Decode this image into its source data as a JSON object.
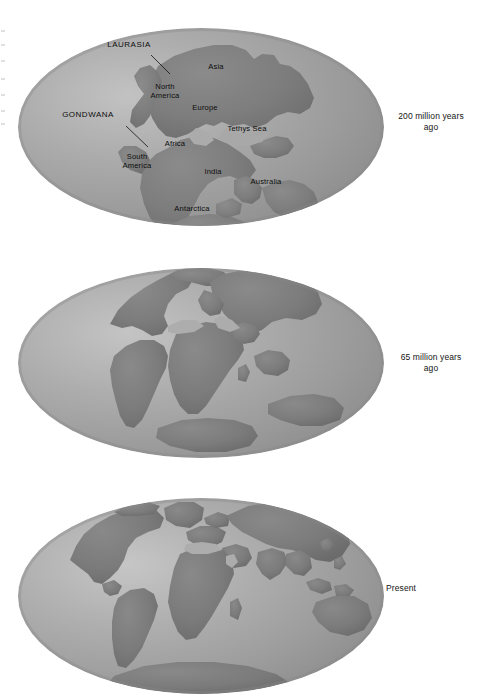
{
  "figure": {
    "kind": "continental-drift-diagram",
    "background_color": "#ffffff",
    "ocean_color": "#a6a6a6",
    "land_color": "#7d7d7d",
    "text_color": "#111111"
  },
  "panels": [
    {
      "id": "panel-200ma",
      "caption": "200 million years\nago",
      "caption_line1": "200 million years",
      "caption_line2": "ago",
      "labels": [
        {
          "name": "laurasia",
          "text": "LAURASIA",
          "style": "caps",
          "x": 103,
          "y": 44,
          "w": 62,
          "leader": [
            151,
            55,
            168,
            73
          ]
        },
        {
          "name": "gondwana",
          "text": "GONDWANA",
          "style": "caps",
          "x": 56,
          "y": 114,
          "w": 70,
          "leader": [
            126,
            126,
            147,
            146
          ]
        },
        {
          "name": "asia",
          "text": "Asia",
          "style": "normal",
          "x": 198,
          "y": 65,
          "w": 34
        },
        {
          "name": "north-america",
          "text": "North\nAmerica",
          "style": "normal",
          "x": 140,
          "y": 86,
          "w": 52
        },
        {
          "name": "europe",
          "text": "Europe",
          "style": "normal",
          "x": 183,
          "y": 106,
          "w": 42
        },
        {
          "name": "tethys-sea",
          "text": "Tethys Sea",
          "style": "normal",
          "x": 218,
          "y": 128,
          "w": 58
        },
        {
          "name": "africa",
          "text": "Africa",
          "style": "normal",
          "x": 156,
          "y": 142,
          "w": 38
        },
        {
          "name": "south-america",
          "text": "South\nAmerica",
          "style": "normal",
          "x": 111,
          "y": 155,
          "w": 52
        },
        {
          "name": "india",
          "text": "India",
          "style": "normal",
          "x": 197,
          "y": 170,
          "w": 32
        },
        {
          "name": "australia",
          "text": "Australia",
          "style": "normal",
          "x": 241,
          "y": 180,
          "w": 48
        },
        {
          "name": "antarctica",
          "text": "Antarctica",
          "style": "normal",
          "x": 164,
          "y": 207,
          "w": 56
        }
      ]
    },
    {
      "id": "panel-65ma",
      "caption": "65 million years\nago",
      "caption_line1": "65 million years",
      "caption_line2": "ago",
      "labels": []
    },
    {
      "id": "panel-present",
      "caption": "Present",
      "caption_line1": "Present",
      "caption_line2": "",
      "labels": []
    }
  ]
}
